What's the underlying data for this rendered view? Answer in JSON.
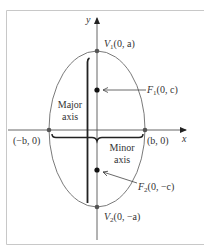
{
  "diagram": {
    "type": "ellipse-vertical-major-axis",
    "axes": {
      "x_label": "x",
      "y_label": "y"
    },
    "vertices": {
      "v1": {
        "name": "V",
        "sub": "1",
        "coords": "(0, a)"
      },
      "v2": {
        "name": "V",
        "sub": "2",
        "coords": "(0, −a)"
      },
      "left": {
        "coords": "(−b, 0)"
      },
      "right": {
        "coords": "(b, 0)"
      }
    },
    "foci": {
      "f1": {
        "name": "F",
        "sub": "1",
        "coords": "(0, c)"
      },
      "f2": {
        "name": "F",
        "sub": "2",
        "coords": "(0, −c)"
      }
    },
    "labels": {
      "major_line1": "Major",
      "major_line2": "axis",
      "minor_line1": "Minor",
      "minor_line2": "axis"
    },
    "colors": {
      "frame": "#c8c8c8",
      "ellipse": "#7a7a7a",
      "axis": "#555555",
      "point": "#222222",
      "text": "#333333"
    }
  }
}
